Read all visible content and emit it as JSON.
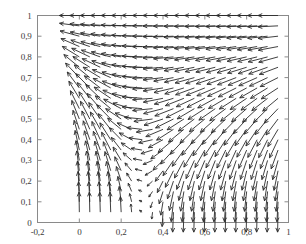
{
  "figure": {
    "type": "quiver-vector-field-plot",
    "background_color": "#ffffff",
    "frame_color": "#8a8a8a",
    "arrow_color": "#2b2b2b",
    "tick_label_color": "#3a3a3a"
  },
  "axes": {
    "x": {
      "min": -0.2,
      "max": 1.0,
      "tick_values": [
        -0.2,
        0,
        0.2,
        0.4,
        0.6,
        0.8,
        1
      ],
      "tick_labels": [
        "-0,2",
        "0",
        "0,2",
        "0,4",
        "0,6",
        "0,8",
        "1"
      ]
    },
    "y": {
      "min": 0.0,
      "max": 1.0,
      "tick_values": [
        0,
        0.1,
        0.2,
        0.3,
        0.4,
        0.5,
        0.6,
        0.7,
        0.8,
        0.9,
        1
      ],
      "tick_labels": [
        "0",
        "0,1",
        "0,2",
        "0,3",
        "0,4",
        "0,5",
        "0,6",
        "0,7",
        "0,8",
        "0,9",
        "1"
      ]
    }
  },
  "chart_data": {
    "type": "quiver",
    "title": "",
    "xlabel": "",
    "ylabel": "",
    "xlim": [
      -0.2,
      1.0
    ],
    "ylim": [
      0.0,
      1.0
    ],
    "grid": false,
    "legend": null,
    "grid_nx": 20,
    "grid_ny": 20,
    "grid_x_start": 0.0,
    "grid_x_step": 0.05,
    "grid_y_start": 0.05,
    "grid_y_step": 0.05,
    "vortex_center": [
      0.52,
      0.58
    ],
    "scale": 0.055
  }
}
